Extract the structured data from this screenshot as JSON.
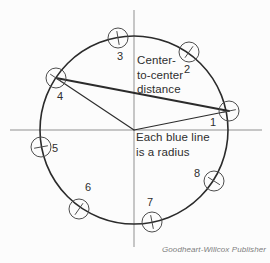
{
  "diagram": {
    "annotations": {
      "center_to_center": "Center-\nto-center\ndistance",
      "radius_note": "Each blue line\nis a radius"
    },
    "attribution": "Goodheart-Willcox Publisher",
    "colors": {
      "main_stroke": "#2b2b2b",
      "small_circle_stroke": "#4d4d4d",
      "axis": "#909090",
      "text": "#2e2e2e",
      "attribution_text": "#7e7e7e",
      "background": "#fcfcfc"
    },
    "main_circle": {
      "cx": 134,
      "cy": 130,
      "r": 94
    },
    "axes": {
      "vertical": {
        "x": 134,
        "y1": 10,
        "y2": 247
      },
      "horizontal": {
        "y": 130,
        "x1": 10,
        "x2": 262
      }
    },
    "points": [
      {
        "label": "1",
        "cx": 229,
        "cy": 111,
        "lx": 213,
        "ly": 126
      },
      {
        "label": "2",
        "cx": 189,
        "cy": 52,
        "lx": 187,
        "ly": 73
      },
      {
        "label": "3",
        "cx": 118,
        "cy": 38,
        "lx": 120,
        "ly": 60
      },
      {
        "label": "4",
        "cx": 56,
        "cy": 78,
        "lx": 60,
        "ly": 100
      },
      {
        "label": "5",
        "cx": 41,
        "cy": 147,
        "lx": 55,
        "ly": 152
      },
      {
        "label": "6",
        "cx": 79,
        "cy": 209,
        "lx": 88,
        "ly": 191
      },
      {
        "label": "7",
        "cx": 152,
        "cy": 222,
        "lx": 150,
        "ly": 206
      },
      {
        "label": "8",
        "cx": 214,
        "cy": 181,
        "lx": 197,
        "ly": 177
      }
    ],
    "small_circle_radius": 10,
    "tick_half_length": 7,
    "lines": [
      {
        "name": "center-to-center-line",
        "x1": 56,
        "y1": 78,
        "x2": 229,
        "y2": 111,
        "w": 1.8
      },
      {
        "name": "radius-line-to-4",
        "x1": 134,
        "y1": 130,
        "x2": 56,
        "y2": 78,
        "w": 1.1
      },
      {
        "name": "radius-line-to-1",
        "x1": 134,
        "y1": 130,
        "x2": 229,
        "y2": 111,
        "w": 1.1
      }
    ]
  }
}
